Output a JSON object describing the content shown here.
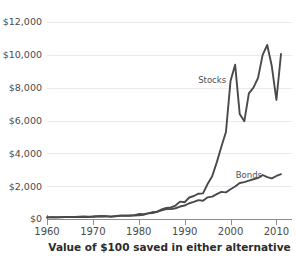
{
  "chart_data": {
    "type": "line",
    "title": "",
    "subtitle": "",
    "caption": "Value of $100 saved in either alternative",
    "xlabel": "",
    "ylabel": "",
    "xlim": [
      1960,
      2011
    ],
    "ylim": [
      0,
      12000
    ],
    "grid": true,
    "legend_position": "inline-annotation",
    "y_ticks": [
      0,
      2000,
      4000,
      6000,
      8000,
      10000,
      12000
    ],
    "y_tick_labels": [
      "$0",
      "$2,000",
      "$4,000",
      "$6,000",
      "$8,000",
      "$10,000",
      "$12,000"
    ],
    "x_ticks": [
      1960,
      1970,
      1980,
      1990,
      2000,
      2010
    ],
    "x_tick_labels": [
      "1960",
      "1970",
      "1980",
      "1990",
      "2000",
      "2010"
    ],
    "line_color": "#4a4a4a",
    "grid_color": "#eceaea",
    "axis_color": "#8e8e8e",
    "background_color": "#ffffff",
    "annotations": [
      {
        "text": "Stocks",
        "x": 1996,
        "y": 8300
      },
      {
        "text": "Bonds",
        "x": 2004,
        "y": 2500
      }
    ],
    "series": [
      {
        "name": "Stocks",
        "x": [
          1960,
          1961,
          1962,
          1963,
          1964,
          1965,
          1966,
          1967,
          1968,
          1969,
          1970,
          1971,
          1972,
          1973,
          1974,
          1975,
          1976,
          1977,
          1978,
          1979,
          1980,
          1981,
          1982,
          1983,
          1984,
          1985,
          1986,
          1987,
          1988,
          1989,
          1990,
          1991,
          1992,
          1993,
          1994,
          1995,
          1996,
          1997,
          1998,
          1999,
          2000,
          2001,
          2002,
          2003,
          2004,
          2005,
          2006,
          2007,
          2008,
          2009,
          2010,
          2011
        ],
        "values": [
          100,
          105,
          100,
          112,
          122,
          130,
          120,
          140,
          150,
          140,
          148,
          165,
          185,
          165,
          130,
          165,
          200,
          190,
          200,
          235,
          300,
          290,
          345,
          420,
          450,
          580,
          680,
          710,
          820,
          1060,
          1020,
          1310,
          1400,
          1540,
          1560,
          2130,
          2600,
          3450,
          4400,
          5300,
          8400,
          9400,
          6400,
          5950,
          7650,
          8000,
          8600,
          10000,
          10600,
          9300,
          7250,
          10050
        ]
      },
      {
        "name": "Bonds",
        "x": [
          1960,
          1961,
          1962,
          1963,
          1964,
          1965,
          1966,
          1967,
          1968,
          1969,
          1970,
          1971,
          1972,
          1973,
          1974,
          1975,
          1976,
          1977,
          1978,
          1979,
          1980,
          1981,
          1982,
          1983,
          1984,
          1985,
          1986,
          1987,
          1988,
          1989,
          1990,
          1991,
          1992,
          1993,
          1994,
          1995,
          1996,
          1997,
          1998,
          1999,
          2000,
          2001,
          2002,
          2003,
          2004,
          2005,
          2006,
          2007,
          2008,
          2009,
          2010,
          2011
        ],
        "values": [
          100,
          103,
          108,
          110,
          114,
          116,
          120,
          118,
          124,
          118,
          135,
          148,
          155,
          158,
          162,
          180,
          205,
          210,
          212,
          215,
          225,
          250,
          340,
          365,
          430,
          520,
          610,
          600,
          655,
          760,
          820,
          960,
          1040,
          1150,
          1110,
          1320,
          1360,
          1510,
          1650,
          1620,
          1810,
          1980,
          2190,
          2250,
          2340,
          2420,
          2500,
          2680,
          2550,
          2470,
          2620,
          2730
        ]
      }
    ]
  }
}
